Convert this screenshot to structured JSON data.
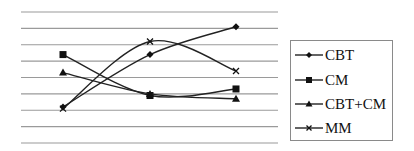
{
  "chart_data": {
    "type": "line",
    "title": "",
    "xlabel": "",
    "ylabel": "",
    "categories": [
      "1",
      "2",
      "3"
    ],
    "ylim": [
      0,
      8
    ],
    "grid": true,
    "gridline_count": 9,
    "legend_position": "right",
    "smoothed": true,
    "series": [
      {
        "name": "CBT",
        "marker": "diamond",
        "values": [
          2.2,
          5.4,
          7.1
        ]
      },
      {
        "name": "CM",
        "marker": "square",
        "values": [
          5.4,
          2.9,
          3.3
        ]
      },
      {
        "name": "CBT+CM",
        "marker": "triangle",
        "values": [
          4.3,
          3.0,
          2.7
        ]
      },
      {
        "name": "MM",
        "marker": "x",
        "values": [
          2.1,
          6.2,
          4.4
        ]
      }
    ]
  },
  "legend": {
    "items": [
      {
        "label": "CBT"
      },
      {
        "label": "CM"
      },
      {
        "label": "CBT+CM"
      },
      {
        "label": "MM"
      }
    ]
  },
  "colors": {
    "line": "#222222",
    "grid": "#9a9a9a",
    "legend_border": "#8a8a8a"
  }
}
